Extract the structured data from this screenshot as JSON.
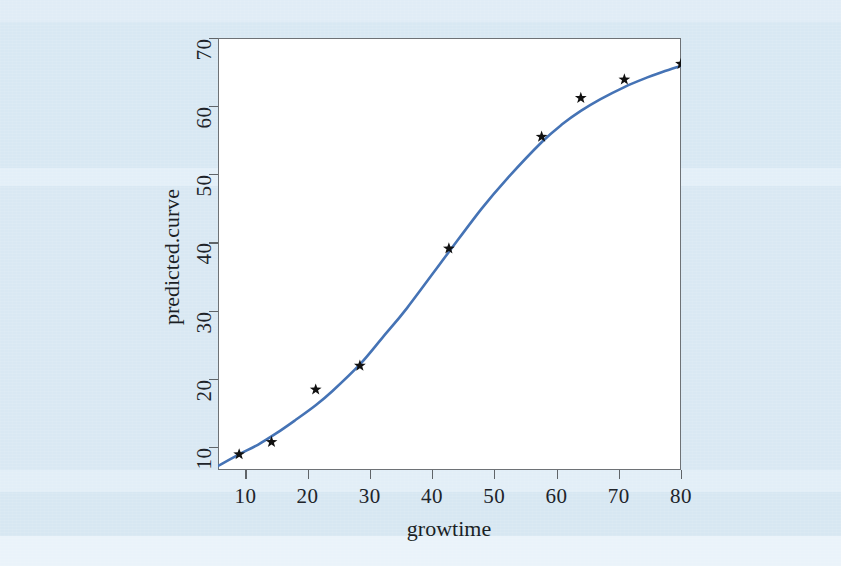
{
  "figure": {
    "background_color": "#dae9f4",
    "plot_background_color": "#ffffff",
    "curve_color": "#4573b5",
    "marker_color": "#111111",
    "axis_color": "#5f6468"
  },
  "chart_data": {
    "type": "line",
    "title": "",
    "subtitle": "",
    "xlabel": "growtime",
    "ylabel": "predicted.curve",
    "xlim": [
      5.6,
      80.0
    ],
    "ylim": [
      6.6,
      70.0
    ],
    "xticks": [
      10,
      20,
      30,
      40,
      50,
      60,
      70,
      80
    ],
    "yticks": [
      10,
      20,
      30,
      40,
      50,
      60,
      70
    ],
    "xtick_labels": [
      "10",
      "20",
      "30",
      "40",
      "50",
      "60",
      "70",
      "80"
    ],
    "ytick_labels": [
      "10",
      "20",
      "30",
      "40",
      "50",
      "60",
      "70"
    ],
    "grid": false,
    "legend": null,
    "legend_position": "none",
    "series": [
      {
        "name": "predicted.curve",
        "type": "line",
        "style": "solid",
        "color": "#4573b5",
        "x": [
          5.6,
          9.0,
          12.0,
          15.0,
          18.0,
          21.3,
          24.0,
          28.4,
          32.0,
          36.0,
          42.7,
          48.0,
          52.0,
          57.6,
          61.0,
          63.9,
          67.0,
          70.9,
          74.0,
          77.0,
          80.0
        ],
        "y": [
          7.2,
          8.9,
          10.3,
          12.0,
          13.9,
          16.1,
          18.2,
          22.1,
          26.0,
          30.4,
          38.6,
          45.0,
          49.3,
          54.7,
          57.4,
          59.3,
          61.0,
          62.8,
          64.0,
          65.0,
          65.9
        ]
      },
      {
        "name": "observed points",
        "type": "scatter",
        "marker": "star",
        "color": "#111111",
        "x": [
          9.0,
          14.2,
          21.3,
          28.4,
          42.7,
          57.6,
          63.9,
          70.9,
          80.0
        ],
        "y": [
          8.9,
          10.7,
          18.4,
          21.9,
          39.1,
          55.5,
          61.2,
          63.9,
          66.2
        ]
      }
    ]
  }
}
